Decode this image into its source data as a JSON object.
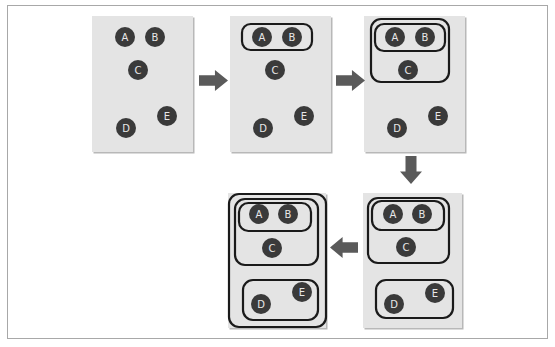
{
  "diagram": {
    "colors": {
      "panel_bg": "#e4e4e4",
      "panel_shadow": "#b8b8b8",
      "node_fill": "#3a3a3a",
      "node_text": "#e8e8e8",
      "cluster_stroke": "#1a1a1a",
      "arrow": "#5a5a5a",
      "frame_border": "#a8a8a8"
    },
    "node_radius": 10,
    "panels": [
      {
        "id": "step-1",
        "rect": [
          92,
          16,
          101,
          136
        ],
        "nodes": [
          {
            "label": "A",
            "x": 125,
            "y": 37
          },
          {
            "label": "B",
            "x": 155,
            "y": 37
          },
          {
            "label": "C",
            "x": 138,
            "y": 70
          },
          {
            "label": "D",
            "x": 126,
            "y": 128
          },
          {
            "label": "E",
            "x": 167,
            "y": 116
          }
        ],
        "clusters": []
      },
      {
        "id": "step-2",
        "rect": [
          230,
          16,
          101,
          136
        ],
        "nodes": [
          {
            "label": "A",
            "x": 262,
            "y": 37
          },
          {
            "label": "B",
            "x": 292,
            "y": 37
          },
          {
            "label": "C",
            "x": 275,
            "y": 70
          },
          {
            "label": "D",
            "x": 263,
            "y": 128
          },
          {
            "label": "E",
            "x": 304,
            "y": 116
          }
        ],
        "clusters": [
          {
            "members": "AB",
            "rect": [
              242,
              24,
              70,
              26
            ]
          }
        ]
      },
      {
        "id": "step-3",
        "rect": [
          364,
          16,
          101,
          136
        ],
        "nodes": [
          {
            "label": "A",
            "x": 395,
            "y": 37
          },
          {
            "label": "B",
            "x": 425,
            "y": 37
          },
          {
            "label": "C",
            "x": 408,
            "y": 70
          },
          {
            "label": "D",
            "x": 397,
            "y": 128
          },
          {
            "label": "E",
            "x": 438,
            "y": 116
          }
        ],
        "clusters": [
          {
            "members": "ABC",
            "rect": [
              371,
              19,
              78,
              63
            ]
          },
          {
            "members": "AB",
            "rect": [
              375,
              24,
              70,
              27
            ]
          }
        ]
      },
      {
        "id": "step-4",
        "rect": [
          363,
          193,
          99,
          135
        ],
        "nodes": [
          {
            "label": "A",
            "x": 393,
            "y": 214
          },
          {
            "label": "B",
            "x": 422,
            "y": 214
          },
          {
            "label": "C",
            "x": 406,
            "y": 247
          },
          {
            "label": "D",
            "x": 394,
            "y": 304
          },
          {
            "label": "E",
            "x": 435,
            "y": 293
          }
        ],
        "clusters": [
          {
            "members": "ABC",
            "rect": [
              368,
              198,
              81,
              65
            ]
          },
          {
            "members": "AB",
            "rect": [
              372,
              201,
              72,
              29
            ]
          },
          {
            "members": "DE",
            "rect": [
              376,
              280,
              77,
              38
            ]
          }
        ]
      },
      {
        "id": "step-5",
        "rect": [
          228,
          193,
          98,
          135
        ],
        "nodes": [
          {
            "label": "A",
            "x": 259,
            "y": 214
          },
          {
            "label": "B",
            "x": 288,
            "y": 214
          },
          {
            "label": "C",
            "x": 272,
            "y": 248
          },
          {
            "label": "D",
            "x": 261,
            "y": 304
          },
          {
            "label": "E",
            "x": 302,
            "y": 292
          }
        ],
        "clusters": [
          {
            "members": "ABCDE",
            "rect": [
              229,
              194,
              97,
              133
            ]
          },
          {
            "members": "ABC",
            "rect": [
              235,
              199,
              83,
              66
            ]
          },
          {
            "members": "AB",
            "rect": [
              239,
              203,
              72,
              28
            ]
          },
          {
            "members": "DE",
            "rect": [
              243,
              280,
              75,
              40
            ]
          }
        ]
      }
    ],
    "arrows": [
      {
        "id": "arrow-1-to-2",
        "direction": "right",
        "x": 199,
        "y": 70,
        "w": 29,
        "h": 21
      },
      {
        "id": "arrow-2-to-3",
        "direction": "right",
        "x": 336,
        "y": 70,
        "w": 29,
        "h": 21
      },
      {
        "id": "arrow-3-to-4",
        "direction": "down",
        "x": 400,
        "y": 156,
        "w": 22,
        "h": 28
      },
      {
        "id": "arrow-4-to-5",
        "direction": "left",
        "x": 330,
        "y": 237,
        "w": 28,
        "h": 21
      }
    ]
  }
}
